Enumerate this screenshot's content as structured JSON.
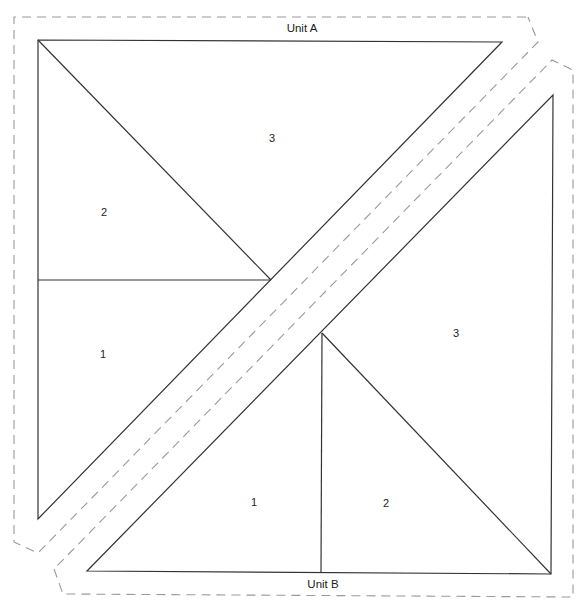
{
  "unit_a": {
    "title": "Unit A",
    "pieces": [
      {
        "id": "a1",
        "label": "1"
      },
      {
        "id": "a2",
        "label": "2"
      },
      {
        "id": "a3",
        "label": "3"
      }
    ]
  },
  "unit_b": {
    "title": "Unit B",
    "pieces": [
      {
        "id": "b1",
        "label": "1"
      },
      {
        "id": "b2",
        "label": "2"
      },
      {
        "id": "b3",
        "label": "3"
      }
    ]
  },
  "colors": {
    "line": "#333333",
    "seam_allowance": "#9a9a9a",
    "background": "#ffffff"
  }
}
